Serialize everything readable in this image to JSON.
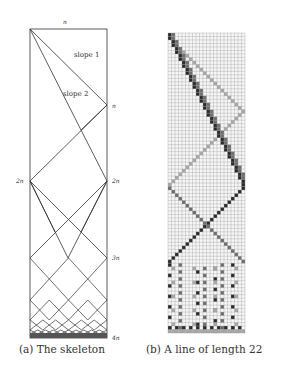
{
  "figures": [
    {
      "id": "a",
      "caption": "(a) The skeleton",
      "labels": {
        "top": "n",
        "right_n": "n",
        "left_2n": "2n",
        "right_2n": "2n",
        "right_3n": "3n",
        "right_4n": "4n",
        "slope1": "slope 1",
        "slope2": "slope 2"
      }
    },
    {
      "id": "b",
      "caption": "(b) A line of length 22",
      "grid": {
        "columns": 22,
        "rows": 86
      }
    }
  ]
}
